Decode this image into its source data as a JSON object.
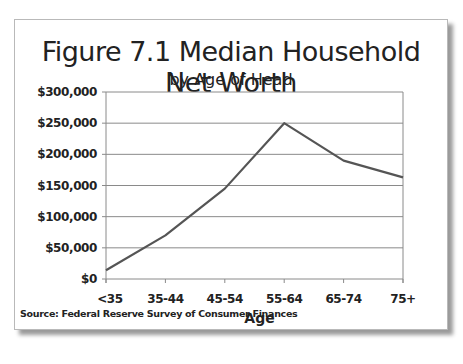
{
  "chart_data": {
    "type": "line",
    "title": "Figure 7.1 Median Household Net Worth",
    "subtitle": "by Age of Head",
    "xlabel": "Age",
    "ylabel": "",
    "categories": [
      "<35",
      "35-44",
      "45-54",
      "55-64",
      "65-74",
      "75+"
    ],
    "series": [
      {
        "name": "Median Household Net Worth",
        "values": [
          14000,
          70000,
          145000,
          250000,
          190000,
          163000
        ],
        "color": "#555555"
      }
    ],
    "ylim": [
      0,
      300000
    ],
    "yticks": [
      0,
      50000,
      100000,
      150000,
      200000,
      250000,
      300000
    ],
    "ytick_labels": [
      "$0",
      "$50,000",
      "$100,000",
      "$150,000",
      "$200,000",
      "$250,000",
      "$300,000"
    ],
    "grid": true,
    "legend": "none",
    "source": "Source: Federal Reserve Survey of Consumer Finances"
  }
}
